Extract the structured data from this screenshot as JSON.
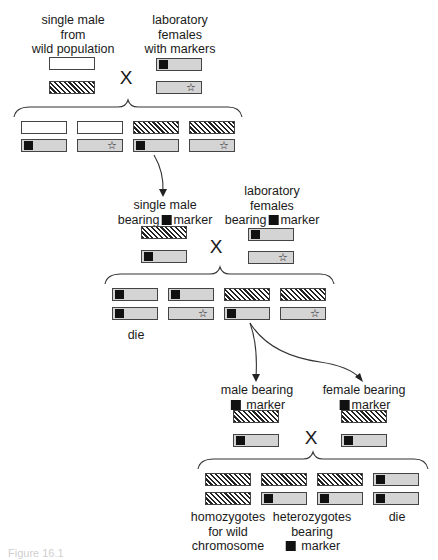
{
  "diagram": {
    "type": "genetic-cross-scheme",
    "cross1": {
      "male_label": "single male\nfrom\nwild population",
      "female_label": "laboratory\nfemales\nwith markers",
      "cross_symbol": "X"
    },
    "cross2": {
      "male_label_line1": "single male",
      "male_label_line2a": "bearing",
      "male_label_line2b": "marker",
      "female_label_line1": "laboratory",
      "female_label_line2": "females",
      "female_label_line3a": "bearing",
      "female_label_line3b": "marker",
      "cross_symbol": "X",
      "offspring_note": "die"
    },
    "cross3": {
      "male_label_line1": "male bearing",
      "male_label_line2": "marker",
      "female_label_line1": "female bearing",
      "female_label_line2": "marker",
      "cross_symbol": "X",
      "outcome_1": "homozygotes\nfor wild\nchromosome",
      "outcome_2_line1": "heterozygotes",
      "outcome_2_line2": "bearing",
      "outcome_2_line3": "marker",
      "outcome_3": "die"
    },
    "legend": {
      "white_box": "wild chromosome (unmarked)",
      "hatched_box": "wild chromosome",
      "gray_box_square": "laboratory chromosome with square marker",
      "gray_box_star": "laboratory chromosome with star marker",
      "star_glyph": "☆"
    },
    "caption_fragment": "Figure 16.1"
  }
}
